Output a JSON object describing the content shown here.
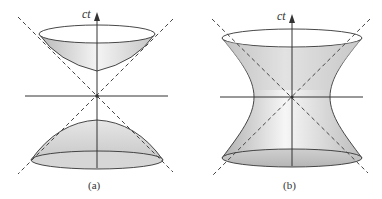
{
  "figure_a": {
    "caption": "(a)",
    "axis_label": "ct",
    "description": "two-sheeted hyperboloid with light cone asymptotes"
  },
  "figure_b": {
    "caption": "(b)",
    "axis_label": "ct",
    "description": "one-sheeted hyperboloid with light cone asymptotes"
  },
  "colors": {
    "line": "#333333",
    "fill_light": "#f2f2f2",
    "fill_dark": "#bdbdbd",
    "dash": "#444444"
  }
}
